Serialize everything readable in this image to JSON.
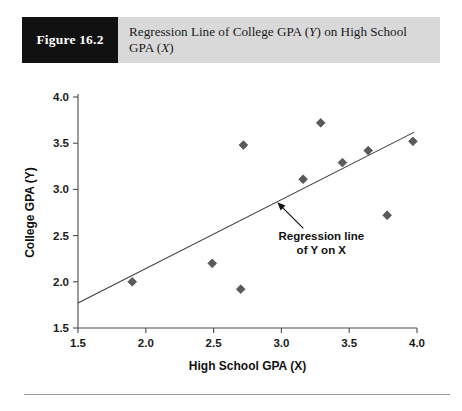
{
  "figure": {
    "number_label": "Figure 16.2",
    "title_part1": "Regression Line of College GPA (",
    "title_italic1": "Y",
    "title_part2": ") on High School GPA (",
    "title_italic2": "X",
    "title_part3": ")"
  },
  "annotation": {
    "line1": "Regression line",
    "line2": "of Y on X"
  },
  "colors": {
    "header_band": "#d9d9d9",
    "number_box": "#111111",
    "marker": "#5a5a5a",
    "axis": "#4a4a4a",
    "regression_line": "#3d3d3d"
  },
  "chart_data": {
    "type": "scatter",
    "title": "Regression Line of College GPA (Y) on High School GPA (X)",
    "xlabel": "High School GPA (X)",
    "ylabel": "College GPA (Y)",
    "xlim": [
      1.5,
      4.0
    ],
    "ylim": [
      1.5,
      4.0
    ],
    "xticks": [
      "1.5",
      "2.0",
      "2.5",
      "3.0",
      "3.5",
      "4.0"
    ],
    "xtick_values": [
      1.5,
      2.0,
      2.5,
      3.0,
      3.5,
      4.0
    ],
    "yticks": [
      "1.5",
      "2.0",
      "2.5",
      "3.0",
      "3.5",
      "4.0"
    ],
    "ytick_values": [
      1.5,
      2.0,
      2.5,
      3.0,
      3.5,
      4.0
    ],
    "grid": false,
    "legend": false,
    "marker_shape": "diamond",
    "points": [
      {
        "x": 1.9,
        "y": 2.0
      },
      {
        "x": 2.49,
        "y": 2.2
      },
      {
        "x": 2.7,
        "y": 1.92
      },
      {
        "x": 2.72,
        "y": 3.48
      },
      {
        "x": 3.16,
        "y": 3.11
      },
      {
        "x": 3.29,
        "y": 3.72
      },
      {
        "x": 3.45,
        "y": 3.29
      },
      {
        "x": 3.64,
        "y": 3.42
      },
      {
        "x": 3.78,
        "y": 2.72
      },
      {
        "x": 3.97,
        "y": 3.52
      }
    ],
    "regression_line": {
      "x_start": 1.5,
      "y_start": 1.77,
      "x_end": 3.98,
      "y_end": 3.62
    },
    "annotation": {
      "text": "Regression line of Y on X",
      "point_to_x": 2.97,
      "point_to_y": 2.86
    }
  }
}
